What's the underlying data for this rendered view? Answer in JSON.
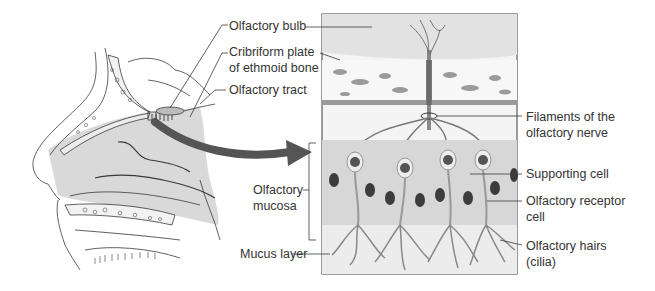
{
  "diagram": {
    "colors": {
      "line": "#3a3a3a",
      "tissue": "#d9d9d9",
      "tissue_light": "#ececec",
      "bone": "#f2f2f2",
      "arrow": "#555555",
      "nucleus": "#3c3c3c",
      "label_text": "#333333"
    },
    "left_panel": {
      "name": "Sagittal section of head (nasal cavity)"
    },
    "detail_panel": {
      "name": "Magnified olfactory epithelium"
    },
    "labels": {
      "olfactory_bulb": "Olfactory bulb",
      "cribriform_line1": "Cribriform plate",
      "cribriform_line2": "of ethmoid bone",
      "olfactory_tract": "Olfactory tract",
      "filaments_line1": "Filaments of the",
      "filaments_line2": "olfactory nerve",
      "supporting_cell": "Supporting cell",
      "receptor_line1": "Olfactory receptor",
      "receptor_line2": "cell",
      "hairs_line1": "Olfactory hairs",
      "hairs_line2": "(cilia)",
      "mucosa_line1": "Olfactory",
      "mucosa_line2": "mucosa",
      "mucus_layer": "Mucus layer"
    }
  }
}
